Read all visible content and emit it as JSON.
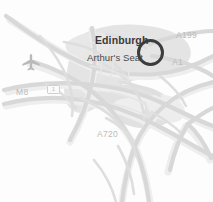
{
  "map": {
    "region_name": "Edinburgh",
    "background_color": "#fdfdfd",
    "urban_area_color": "#e3e3e3",
    "road_color": "#d9d9d9",
    "road_casing_color": "#ececec",
    "marker_color": "#3c3c3c",
    "city_label_color": "#3a3a3a",
    "poi_label_color": "#4a4a4a",
    "road_label_color": "#bcbcbc",
    "labels": {
      "city": "Edinburgh",
      "poi": "Arthur's Seat"
    },
    "road_labels": [
      {
        "text": "A199",
        "x": 176,
        "y": 31
      },
      {
        "text": "A1",
        "x": 172,
        "y": 58
      },
      {
        "text": "M8",
        "x": 16,
        "y": 88
      },
      {
        "text": "A720",
        "x": 97,
        "y": 130
      }
    ],
    "shield_label": "1",
    "icons": {
      "airport": "airplane-icon",
      "highlight": "circle-marker-icon"
    }
  }
}
